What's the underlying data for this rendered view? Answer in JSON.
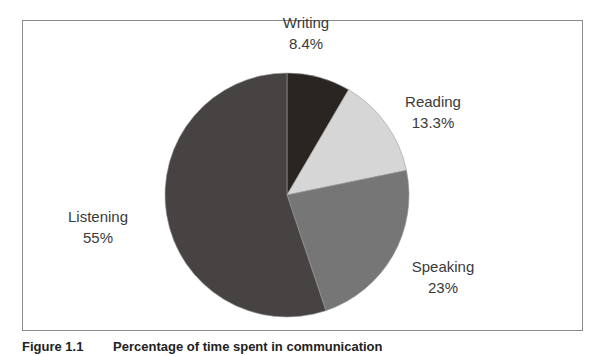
{
  "chart_data": {
    "type": "pie",
    "title": "",
    "start_angle": "12 o'clock, clockwise",
    "categories": [
      "Writing",
      "Reading",
      "Speaking",
      "Listening"
    ],
    "values": [
      8.4,
      13.3,
      23,
      55
    ],
    "labels": [
      "8.4%",
      "13.3%",
      "23%",
      "55%"
    ],
    "colors": [
      "#2b2522",
      "#d6d6d6",
      "#767676",
      "#474342"
    ],
    "legend": "none (direct labels)"
  },
  "slices": [
    {
      "name": "Writing",
      "pct": "8.4%"
    },
    {
      "name": "Reading",
      "pct": "13.3%"
    },
    {
      "name": "Speaking",
      "pct": "23%"
    },
    {
      "name": "Listening",
      "pct": "55%"
    }
  ],
  "caption": {
    "number": "Figure 1.1",
    "text": "Percentage of time spent in communication"
  }
}
